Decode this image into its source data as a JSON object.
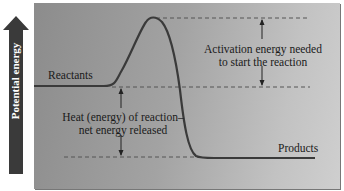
{
  "diagram": {
    "type": "energy-profile",
    "y_axis": {
      "label": "Potential energy",
      "direction": "up",
      "arrow_color": "#3a3a3a"
    },
    "levels": {
      "reactants": {
        "label": "Reactants"
      },
      "products": {
        "label": "Products"
      },
      "transition_peak": {}
    },
    "annotations": {
      "activation_energy": {
        "line1": "Activation energy needed",
        "line2": "to start the reaction"
      },
      "heat_of_reaction": {
        "line1": "Heat (energy) of reaction–",
        "line2": "net energy released"
      }
    },
    "colors": {
      "panel_dark": "#8c8c8c",
      "panel_light": "#cfcfcf",
      "curve": "#3a3a3a",
      "dashed": "#555555"
    }
  }
}
